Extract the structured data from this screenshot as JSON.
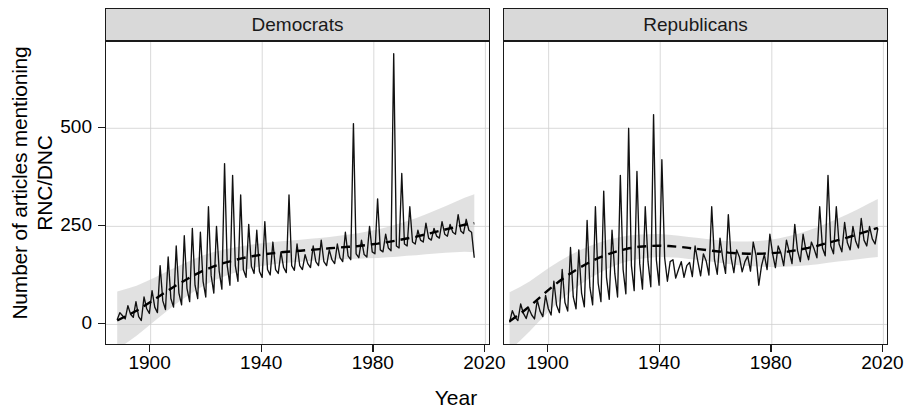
{
  "chart_data": {
    "type": "line",
    "title": "",
    "xlabel": "Year",
    "ylabel": "Number of articles mentioning\nRNC/DNC",
    "facet_labels": [
      "Democrats",
      "Republicans"
    ],
    "grid": true,
    "legend": "none",
    "xlim": [
      1884,
      2022
    ],
    "ylim": [
      -55,
      720
    ],
    "xticks": [
      1900,
      1940,
      1980,
      2020
    ],
    "xtick_labels": [
      "1900",
      "1940",
      "1980",
      "2020"
    ],
    "yticks": [
      0,
      250,
      500
    ],
    "ytick_labels": [
      "0",
      "250",
      "500"
    ],
    "series_color": "#111111",
    "trend_color": "#000000",
    "ribbon_color": "#c8c8c8",
    "strip_color": "#d9d9d9",
    "panels": [
      {
        "name": "Democrats",
        "x_start": 1888,
        "x_end": 2016,
        "values": [
          12,
          30,
          22,
          14,
          48,
          26,
          18,
          58,
          20,
          10,
          70,
          40,
          28,
          86,
          44,
          30,
          150,
          60,
          38,
          172,
          66,
          44,
          200,
          80,
          50,
          226,
          92,
          58,
          245,
          100,
          66,
          235,
          110,
          70,
          300,
          125,
          80,
          250,
          136,
          90,
          410,
          150,
          100,
          380,
          150,
          110,
          330,
          140,
          120,
          255,
          148,
          130,
          240,
          135,
          120,
          262,
          140,
          126,
          210,
          140,
          130,
          185,
          145,
          132,
          330,
          150,
          138,
          205,
          150,
          140,
          178,
          155,
          145,
          200,
          160,
          150,
          215,
          160,
          150,
          190,
          165,
          155,
          205,
          170,
          160,
          235,
          175,
          165,
          512,
          180,
          170,
          215,
          178,
          172,
          250,
          185,
          180,
          320,
          190,
          185,
          230,
          195,
          188,
          690,
          200,
          195,
          385,
          205,
          200,
          300,
          210,
          205,
          240,
          215,
          210,
          258,
          220,
          215,
          245,
          225,
          220,
          262,
          230,
          225,
          255,
          235,
          230,
          280,
          238,
          232,
          268,
          240,
          235,
          170
        ],
        "trend": [
          10,
          22,
          35,
          50,
          66,
          82,
          98,
          112,
          126,
          138,
          148,
          156,
          163,
          169,
          174,
          178,
          181,
          184,
          186,
          188,
          190,
          192,
          194,
          196,
          198,
          200,
          203,
          206,
          210,
          214,
          219,
          224,
          230,
          236,
          242,
          248,
          254,
          258
        ]
      },
      {
        "name": "Republicans",
        "x_start": 1886,
        "x_end": 2018,
        "values": [
          5,
          35,
          18,
          10,
          52,
          28,
          15,
          40,
          24,
          14,
          62,
          34,
          20,
          74,
          40,
          24,
          110,
          48,
          30,
          140,
          56,
          34,
          196,
          70,
          40,
          190,
          80,
          45,
          265,
          95,
          50,
          300,
          105,
          58,
          340,
          120,
          64,
          240,
          130,
          70,
          380,
          140,
          78,
          500,
          150,
          86,
          390,
          155,
          90,
          300,
          160,
          96,
          535,
          165,
          100,
          420,
          170,
          110,
          160,
          165,
          118,
          140,
          160,
          120,
          150,
          158,
          122,
          200,
          160,
          124,
          180,
          162,
          126,
          300,
          165,
          128,
          220,
          168,
          130,
          280,
          170,
          132,
          190,
          172,
          134,
          160,
          174,
          136,
          210,
          176,
          100,
          150,
          178,
          140,
          230,
          180,
          145,
          200,
          182,
          150,
          215,
          185,
          155,
          255,
          188,
          160,
          230,
          190,
          165,
          210,
          192,
          170,
          300,
          195,
          175,
          380,
          200,
          180,
          300,
          205,
          185,
          260,
          208,
          190,
          250,
          212,
          195,
          270,
          215,
          200,
          250,
          218,
          205,
          245
        ],
        "trend": [
          8,
          26,
          46,
          68,
          90,
          110,
          128,
          144,
          158,
          170,
          180,
          188,
          194,
          198,
          200,
          201,
          200,
          198,
          195,
          192,
          189,
          186,
          183,
          181,
          180,
          180,
          181,
          183,
          186,
          190,
          195,
          201,
          208,
          215,
          222,
          230,
          238,
          246
        ]
      }
    ]
  },
  "axis": {
    "ylabel_text": "Number of articles mentioning\nRNC/DNC",
    "xlabel_text": "Year"
  }
}
